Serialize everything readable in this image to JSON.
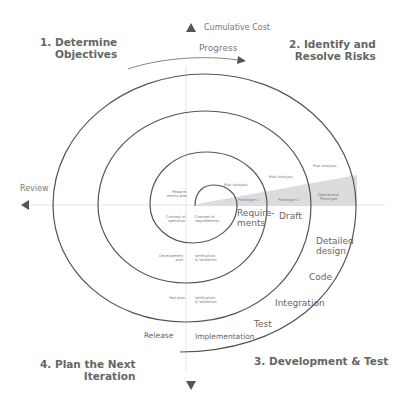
{
  "quadrants": {
    "q1": {
      "line1": "1. Determine",
      "line2": "Objectives"
    },
    "q2": {
      "line1": "2. Identify and",
      "line2": "Resolve Risks"
    },
    "q3": {
      "line1": "3. Development & Test"
    },
    "q4": {
      "line1": "4. Plan the Next",
      "line2": "Iteration"
    }
  },
  "axes": {
    "cumulative_cost": "Cumulative Cost",
    "progress": "Progress",
    "review": "Review"
  },
  "inner_labels": {
    "requirements_plan": {
      "line1": "Require-",
      "line2": "ments plan"
    },
    "concept_of_operation": {
      "line1": "Concept of",
      "line2": "operation"
    },
    "concept_of_requirements": {
      "line1": "Concept of",
      "line2": "requirements"
    },
    "development_plan": {
      "line1": "Development",
      "line2": "plan"
    },
    "vv1": {
      "line1": "Verification",
      "line2": "& Validation"
    },
    "test_plan": "Test plan",
    "vv2": {
      "line1": "Verification",
      "line2": "& Validation"
    },
    "risk_analysis_1": "Risk Analysis",
    "risk_analysis_2": "Risk Analysis",
    "risk_analysis_3": "Risk Analysis",
    "prototype_1": "Prototype 1",
    "prototype_2": "Prototype 2",
    "operational_prototype": {
      "line1": "Operational",
      "line2": "Prototype"
    }
  },
  "stage_labels": {
    "requirements": {
      "line1": "Require-",
      "line2": "ments"
    },
    "draft": "Draft",
    "detailed_design": {
      "line1": "Detailed",
      "line2": "design"
    },
    "code": "Code",
    "integration": "Integration",
    "test": "Test",
    "implementation": "Implementation",
    "release": "Release"
  },
  "colors": {
    "spiral": "#555555",
    "axis": "#e6e6e6",
    "wedge": "#d9d9d9",
    "arrow": "#555555"
  }
}
